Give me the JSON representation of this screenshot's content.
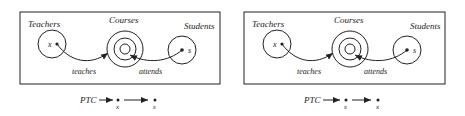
{
  "colors": {
    "ink": "#222222",
    "background": "#ffffff"
  },
  "diagrams": [
    {
      "sets": {
        "left": "Teachers",
        "center": "Courses",
        "right": "Students"
      },
      "elements": {
        "left": "x",
        "right": "s"
      },
      "relations": {
        "left": "teaches",
        "right": "attends"
      },
      "formula": {
        "prefix": "PTC",
        "first_var": "x",
        "second_var": "s"
      }
    },
    {
      "sets": {
        "left": "Teachers",
        "center": "Courses",
        "right": "Students"
      },
      "elements": {
        "left": "x",
        "right": "s"
      },
      "relations": {
        "left": "teaches",
        "right": "attends"
      },
      "formula": {
        "prefix": "PTC",
        "first_var": "s",
        "second_var": "x"
      }
    }
  ]
}
